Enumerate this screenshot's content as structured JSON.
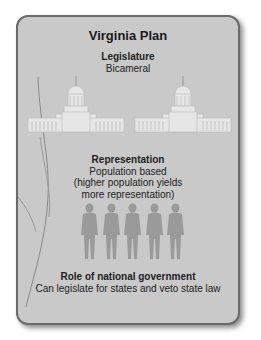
{
  "card": {
    "title": "Virginia Plan",
    "background_color": "#c9c9c9",
    "border_color": "#6a6a6a"
  },
  "sections": {
    "legislature": {
      "heading": "Legislature",
      "lines": [
        "Bicameral"
      ],
      "icons": [
        "capitol-building-icon",
        "capitol-building-icon"
      ]
    },
    "representation": {
      "heading": "Representation",
      "lines": [
        "Population based",
        "(higher population yields",
        "more representation)"
      ],
      "icons": [
        "person-icon",
        "person-icon",
        "person-icon",
        "person-icon",
        "person-icon"
      ]
    },
    "role": {
      "heading": "Role of national government",
      "lines": [
        "Can legislate for states and veto state law"
      ]
    }
  }
}
